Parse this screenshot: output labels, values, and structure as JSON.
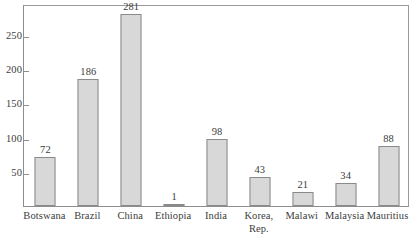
{
  "chart_data": {
    "type": "bar",
    "title": "",
    "subtitle": "",
    "xlabel": "",
    "ylabel": "",
    "categories": [
      "Botswana",
      "Brazil",
      "China",
      "Ethiopia",
      "India",
      "Korea,\nRep.",
      "Malawi",
      "Malaysia",
      "Mauritius"
    ],
    "values": [
      72,
      186,
      281,
      1,
      98,
      43,
      21,
      34,
      88
    ],
    "data_labels": [
      "72",
      "186",
      "281",
      "1",
      "98",
      "43",
      "21",
      "34",
      "88"
    ],
    "ylim": [
      0,
      295
    ],
    "yticks": [
      50,
      100,
      150,
      200,
      250
    ],
    "ytick_labels": [
      "50",
      "100",
      "150",
      "200",
      "250"
    ],
    "grid": false,
    "legend": false,
    "legend_position": "none",
    "bar_fill_color": "#d8d8d8",
    "bar_border_color": "#8a8a8a",
    "axis_color": "#8d8d8d",
    "text_color": "#3c3c3c",
    "background_color": "#ffffff"
  }
}
